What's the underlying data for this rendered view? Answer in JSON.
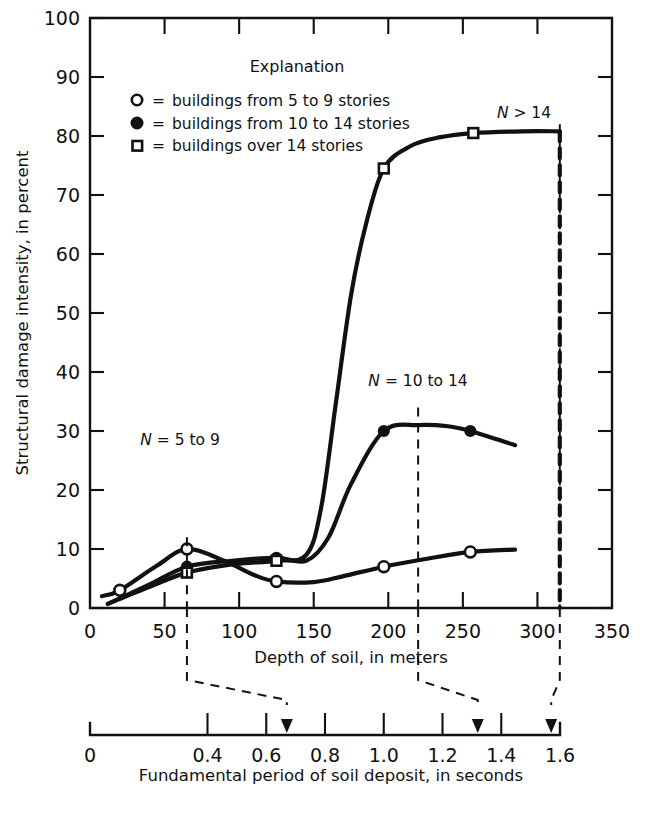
{
  "chart_data": {
    "type": "line",
    "title": "",
    "xlabel": "Depth of soil, in meters",
    "ylabel": "Structural damage intensity, in percent",
    "xlim": [
      0,
      350
    ],
    "ylim": [
      0,
      100
    ],
    "xticks": [
      0,
      50,
      100,
      150,
      200,
      250,
      300,
      350
    ],
    "xticklabels": [
      "0",
      "50",
      "100",
      "150",
      "200",
      "250",
      "300",
      "350"
    ],
    "yticks": [
      0,
      10,
      20,
      30,
      40,
      50,
      60,
      70,
      80,
      90,
      100
    ],
    "yticklabels": [
      "0",
      "10",
      "20",
      "30",
      "40",
      "50",
      "60",
      "70",
      "80",
      "90",
      "100"
    ],
    "grid": false,
    "legend_position": "upper-center",
    "secondary_axis": {
      "label": "Fundamental period of soil deposit, in seconds",
      "lim": [
        0,
        1.6
      ],
      "ticks": [
        0,
        0.2,
        0.4,
        0.6,
        0.8,
        1.0,
        1.2,
        1.4,
        1.6
      ],
      "ticklabels": [
        "0",
        "",
        "0.4",
        "0.6",
        "0.8",
        "1.0",
        "1.2",
        "1.4",
        "1.6"
      ],
      "labeled_ticks": [
        {
          "value": 0,
          "label": "0"
        },
        {
          "value": 0.4,
          "label": "0.4"
        },
        {
          "value": 0.6,
          "label": "0.6"
        },
        {
          "value": 0.8,
          "label": "0.8"
        },
        {
          "value": 1.0,
          "label": "1.0"
        },
        {
          "value": 1.2,
          "label": "1.2"
        },
        {
          "value": 1.4,
          "label": "1.4"
        },
        {
          "value": 1.6,
          "label": "1.6"
        }
      ],
      "arrow_markers": [
        0.67,
        1.32,
        1.57
      ]
    },
    "reference_lines": [
      {
        "depth": 65,
        "period": 0.67
      },
      {
        "depth": 220,
        "period": 1.32
      },
      {
        "depth": 315,
        "period": 1.57
      }
    ],
    "series": [
      {
        "name": "N = 5 to 9",
        "marker": "open-circle",
        "label": "N = 5 to 9",
        "points": [
          {
            "x": 20,
            "y": 3.0
          },
          {
            "x": 65,
            "y": 10.0
          },
          {
            "x": 125,
            "y": 4.5
          },
          {
            "x": 197,
            "y": 7.0
          },
          {
            "x": 255,
            "y": 9.5
          }
        ],
        "path_x": [
          8,
          20,
          45,
          65,
          90,
          110,
          125,
          150,
          170,
          197,
          225,
          255,
          285
        ],
        "path_y": [
          2.0,
          3.0,
          7.2,
          10.0,
          8.0,
          5.6,
          4.5,
          4.4,
          5.4,
          7.0,
          8.3,
          9.5,
          9.9
        ]
      },
      {
        "name": "N = 10 to 14",
        "marker": "filled-circle",
        "label": "N = 10 to 14",
        "points": [
          {
            "x": 65,
            "y": 7.0
          },
          {
            "x": 125,
            "y": 8.5
          },
          {
            "x": 197,
            "y": 30.0
          },
          {
            "x": 255,
            "y": 30.0
          }
        ],
        "path_x": [
          12,
          40,
          65,
          95,
          125,
          145,
          160,
          175,
          197,
          220,
          240,
          255,
          285
        ],
        "path_y": [
          0.7,
          4.0,
          7.0,
          8.0,
          8.5,
          8.0,
          12.0,
          21.0,
          30.0,
          31.0,
          30.8,
          30.0,
          27.6
        ]
      },
      {
        "name": "N > 14",
        "marker": "open-square",
        "label": "N > 14",
        "points": [
          {
            "x": 65,
            "y": 6.0
          },
          {
            "x": 125,
            "y": 8.0
          },
          {
            "x": 197,
            "y": 74.5
          },
          {
            "x": 257,
            "y": 80.5
          }
        ],
        "path_x": [
          12,
          40,
          65,
          95,
          125,
          145,
          155,
          165,
          175,
          185,
          197,
          215,
          235,
          257,
          290,
          315
        ],
        "path_y": [
          0.7,
          3.6,
          6.0,
          7.4,
          8.0,
          9.0,
          17.0,
          35.0,
          53.0,
          65.0,
          74.5,
          78.3,
          79.8,
          80.5,
          80.8,
          80.8
        ],
        "terminates_vertical_at": {
          "x": 315,
          "from_y": 80.8,
          "to_y": 0
        }
      }
    ],
    "annotations": [
      {
        "text": "N = 5 to 9",
        "x": 60,
        "y": 17
      },
      {
        "text": "N = 10 to 14",
        "x": 215,
        "y": 36
      },
      {
        "text": "N > 14",
        "x": 270,
        "y": 85
      }
    ]
  },
  "legend": {
    "title": "Explanation",
    "entries": [
      {
        "marker": "open-circle",
        "equals": "=",
        "label": "buildings from 5 to 9 stories"
      },
      {
        "marker": "filled-circle",
        "equals": "=",
        "label": "buildings from 10 to 14 stories"
      },
      {
        "marker": "open-square",
        "equals": "=",
        "label": "buildings over 14 stories"
      }
    ]
  },
  "axes": {
    "y_title": "Structural damage intensity, in percent",
    "x_title": "Depth of soil, in meters",
    "secondary_title": "Fundamental period of soil deposit, in seconds"
  },
  "curve_labels": {
    "low": {
      "var": "N",
      "rest": " = 5 to 9"
    },
    "mid": {
      "var": "N",
      "rest": " = 10 to 14"
    },
    "high": {
      "var": "N",
      "rest": " > 14"
    }
  },
  "colors": {
    "ink": "#111111",
    "background": "#ffffff"
  }
}
